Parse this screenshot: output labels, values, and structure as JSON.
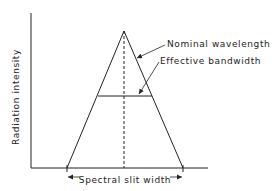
{
  "diagram": {
    "y_axis_label": "Radiation intensity",
    "annotations": {
      "nominal_wavelength": "Nominal wavelength",
      "effective_bandwidth": "Effective bandwidth",
      "spectral_slit_width": "Spectral slit width"
    },
    "colors": {
      "line": "#222222",
      "background": "#ffffff"
    }
  }
}
